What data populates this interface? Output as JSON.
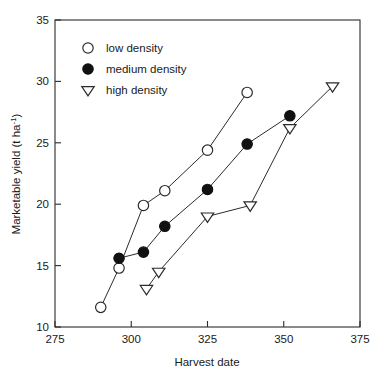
{
  "chart_data": {
    "type": "scatter",
    "title": "",
    "xlabel": "Harvest date",
    "ylabel": "Marketable yield (t ha⁻¹)",
    "ylabel_main": "Marketable yield (t ha",
    "ylabel_sup": "-1",
    "ylabel_tail": ")",
    "xlim": [
      275,
      375
    ],
    "ylim": [
      10,
      35
    ],
    "xticks": [
      275,
      300,
      325,
      350,
      375
    ],
    "yticks": [
      10,
      15,
      20,
      25,
      30,
      35
    ],
    "xticklabels": [
      "275",
      "300",
      "325",
      "350",
      "375"
    ],
    "yticklabels": [
      "10",
      "15",
      "20",
      "25",
      "30",
      "35"
    ],
    "grid": false,
    "legend_position": "upper left",
    "connected": true,
    "series": [
      {
        "name": "low density",
        "marker": "open-circle",
        "color": "#111111",
        "x": [
          290,
          296,
          304,
          311,
          325,
          338
        ],
        "y": [
          11.6,
          14.8,
          19.9,
          21.1,
          24.4,
          29.1
        ]
      },
      {
        "name": "medium density",
        "marker": "filled-circle",
        "color": "#111111",
        "x": [
          296,
          304,
          311,
          325,
          338,
          352
        ],
        "y": [
          15.6,
          16.1,
          18.2,
          21.2,
          24.9,
          27.2
        ]
      },
      {
        "name": "high density",
        "marker": "open-down-triangle",
        "color": "#111111",
        "x": [
          305,
          309,
          325,
          339,
          352,
          366
        ],
        "y": [
          13.1,
          14.5,
          19.0,
          19.9,
          26.2,
          29.6
        ]
      }
    ]
  },
  "legend": {
    "items": [
      {
        "label": "low density",
        "marker": "open-circle"
      },
      {
        "label": "medium density",
        "marker": "filled-circle"
      },
      {
        "label": "high density",
        "marker": "open-down-triangle"
      }
    ]
  }
}
